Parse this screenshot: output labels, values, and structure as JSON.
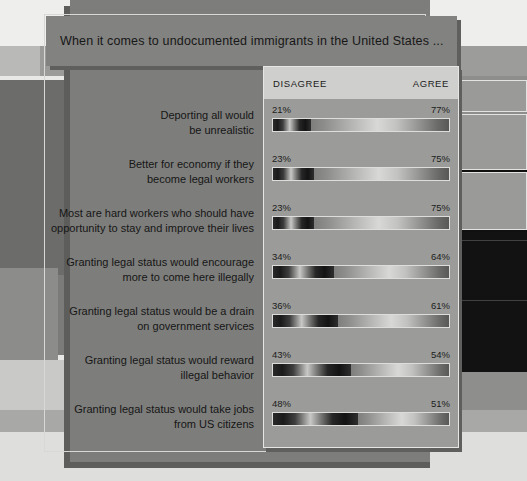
{
  "title": "When it comes to undocumented immigrants in the United States ...",
  "header": {
    "disagree_label": "DISAGREE",
    "agree_label": "AGREE"
  },
  "colors": {
    "panel": "#7d7d7b",
    "card": "#9b9b99",
    "card_header": "#cfcfcd",
    "title_bar": "#828280",
    "text": "#161616",
    "border": "#e6e6e4",
    "disagree_bar": "#1a1a1a",
    "agree_bar": "#c2c2c0"
  },
  "chart_data": {
    "type": "bar",
    "orientation": "horizontal-stacked",
    "title": "When it comes to undocumented immigrants in the United States ...",
    "xlabel": "",
    "ylabel": "",
    "xlim": [
      0,
      100
    ],
    "grid": false,
    "legend_position": "top",
    "legend": [
      "DISAGREE",
      "AGREE"
    ],
    "categories": [
      "Deporting all would be unrealistic",
      "Better for economy if they become legal workers",
      "Most are hard workers who should have opportunity to stay and improve their lives",
      "Granting legal status would encourage more to come here illegally",
      "Granting legal status would be a drain on government services",
      "Granting legal status would reward illegal behavior",
      "Granting legal status would take jobs from US citizens"
    ],
    "series": [
      {
        "name": "DISAGREE",
        "values": [
          21,
          23,
          23,
          34,
          36,
          43,
          48
        ]
      },
      {
        "name": "AGREE",
        "values": [
          77,
          75,
          75,
          64,
          61,
          54,
          51
        ]
      }
    ]
  },
  "rows": [
    {
      "label_lines": [
        "Deporting all would",
        "be unrealistic"
      ],
      "disagree": "21%",
      "agree": "77%",
      "disagree_value": 21,
      "agree_value": 77
    },
    {
      "label_lines": [
        "Better for economy if they",
        "become legal workers"
      ],
      "disagree": "23%",
      "agree": "75%",
      "disagree_value": 23,
      "agree_value": 75
    },
    {
      "label_lines": [
        "Most are hard workers who should have",
        "opportunity to stay and improve their lives"
      ],
      "disagree": "23%",
      "agree": "75%",
      "disagree_value": 23,
      "agree_value": 75
    },
    {
      "label_lines": [
        "Granting legal status would encourage",
        "more to come here illegally"
      ],
      "disagree": "34%",
      "agree": "64%",
      "disagree_value": 34,
      "agree_value": 64
    },
    {
      "label_lines": [
        "Granting legal status would be a drain",
        "on government services"
      ],
      "disagree": "36%",
      "agree": "61%",
      "disagree_value": 36,
      "agree_value": 61
    },
    {
      "label_lines": [
        "Granting legal status would reward",
        "illegal behavior"
      ],
      "disagree": "43%",
      "agree": "54%",
      "disagree_value": 43,
      "agree_value": 54
    },
    {
      "label_lines": [
        "Granting legal status would take jobs",
        "from US citizens"
      ],
      "disagree": "48%",
      "agree": "51%",
      "disagree_value": 48,
      "agree_value": 51
    }
  ]
}
